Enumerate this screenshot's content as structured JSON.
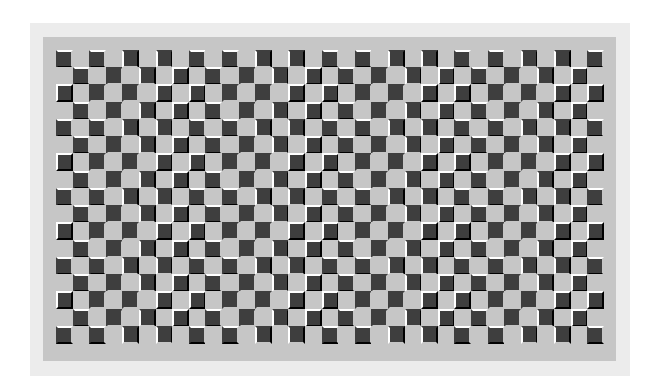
{
  "figure": {
    "title": "",
    "colors": {
      "page_background": "#ffffff",
      "outer_frame": "#ececec",
      "inner_panel": "#c6c6c6",
      "dark_square": "#3e3e3e",
      "light_square": "#c6c6c6",
      "highlight_light": "#ffffff",
      "highlight_dark": "#000000"
    },
    "grid": {
      "columns": 33,
      "rows": 17,
      "cell_width": 16.6,
      "cell_height": 17.24,
      "first_cell_dark": true,
      "edge_width": 2,
      "region_size_cols": 4,
      "region_size_rows": 4
    }
  }
}
